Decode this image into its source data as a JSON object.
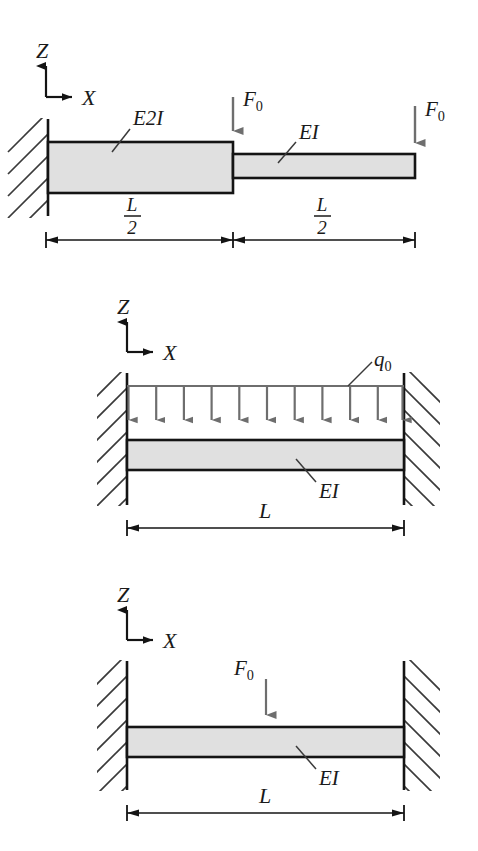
{
  "document": {
    "title": "Beam Loading Diagrams",
    "background_color": "#ffffff",
    "line_color": "#1a1a1a",
    "beam_fill_color": "#e0e0e0",
    "arrow_color": "#6e6e6e",
    "hatch_color": "#3a3a3a"
  },
  "figures": [
    {
      "id": "figure-1",
      "name": "stepped-cantilever-beam",
      "axes": {
        "z_label": "Z",
        "x_label": "X"
      },
      "labels": {
        "segment_left": "E2I",
        "segment_right": "EI",
        "load_mid": "F",
        "load_mid_sub": "0",
        "load_end": "F",
        "load_end_sub": "0"
      },
      "dimensions": [
        {
          "numerator": "L",
          "denominator": "2"
        },
        {
          "numerator": "L",
          "denominator": "2"
        }
      ],
      "support": "fixed-left"
    },
    {
      "id": "figure-2",
      "name": "fixed-fixed-beam-distributed-load",
      "axes": {
        "z_label": "Z",
        "x_label": "X"
      },
      "labels": {
        "distributed_load": "q",
        "distributed_load_sub": "0",
        "beam_property": "EI"
      },
      "dimensions": [
        {
          "numerator": "L",
          "denominator": ""
        }
      ],
      "load_arrow_count": 11,
      "support": "fixed-both-ends"
    },
    {
      "id": "figure-3",
      "name": "fixed-fixed-beam-point-load",
      "axes": {
        "z_label": "Z",
        "x_label": "X"
      },
      "labels": {
        "point_load": "F",
        "point_load_sub": "0",
        "beam_property": "EI"
      },
      "dimensions": [
        {
          "numerator": "L",
          "denominator": ""
        }
      ],
      "support": "fixed-both-ends"
    }
  ]
}
